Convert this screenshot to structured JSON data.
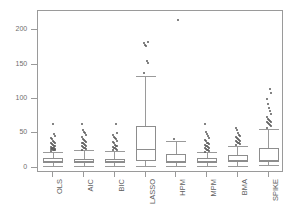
{
  "chart_data": {
    "type": "box",
    "title": "",
    "xlabel": "",
    "ylabel": "",
    "ylim": [
      -8,
      228
    ],
    "yticks": [
      0,
      50,
      100,
      150,
      200
    ],
    "ytick_labels": [
      "0",
      "50",
      "100",
      "150",
      "200"
    ],
    "grid": false,
    "legend": null,
    "categories": [
      "OLS",
      "AIC",
      "BIC",
      "LASSO",
      "HPM",
      "MPM",
      "BMA",
      "SPIKE"
    ],
    "boxes": [
      {
        "name": "OLS",
        "whisker_low": 2.0,
        "q1": 6.5,
        "median": 9.5,
        "q3": 13.5,
        "whisker_high": 23.0,
        "outliers": [
          24.0,
          25.0,
          25.5,
          26.0,
          26.5,
          27.0,
          27.5,
          28.0,
          28.5,
          29.0,
          30.0,
          31.0,
          32.0,
          33.0,
          34.0,
          35.0,
          36.0,
          37.5,
          39.0,
          41.0,
          43.0,
          46.0,
          49.0,
          64.0
        ]
      },
      {
        "name": "AIC",
        "whisker_low": 2.0,
        "q1": 6.0,
        "median": 9.0,
        "q3": 13.0,
        "whisker_high": 25.0,
        "outliers": [
          26.0,
          27.0,
          28.0,
          29.0,
          30.0,
          31.0,
          32.0,
          33.0,
          34.0,
          35.0,
          36.0,
          37.0,
          38.5,
          40.0,
          42.0,
          44.0,
          47.0,
          50.0,
          52.0,
          55.0,
          63.0
        ]
      },
      {
        "name": "BIC",
        "whisker_low": 2.0,
        "q1": 6.0,
        "median": 9.0,
        "q3": 13.0,
        "whisker_high": 24.0,
        "outliers": [
          25.0,
          26.0,
          27.0,
          28.0,
          29.0,
          30.0,
          31.0,
          32.0,
          33.5,
          35.0,
          37.0,
          39.0,
          41.0,
          43.0,
          45.0,
          48.0,
          51.0,
          63.0
        ]
      },
      {
        "name": "LASSO",
        "whisker_low": 1.5,
        "q1": 9.0,
        "median": 26.5,
        "q3": 60.5,
        "whisker_high": 133.0,
        "outliers": [
          138.0,
          152.0,
          155.0,
          177.0,
          179.0,
          182.0,
          183.5
        ]
      },
      {
        "name": "HPM",
        "whisker_low": 2.0,
        "q1": 7.0,
        "median": 10.0,
        "q3": 19.5,
        "whisker_high": 38.0,
        "outliers": [
          41.0,
          215.0
        ]
      },
      {
        "name": "MPM",
        "whisker_low": 2.0,
        "q1": 6.0,
        "median": 9.0,
        "q3": 14.0,
        "whisker_high": 22.0,
        "outliers": [
          23.0,
          24.0,
          25.0,
          26.0,
          27.0,
          28.0,
          29.0,
          30.0,
          31.0,
          32.0,
          33.0,
          34.0,
          35.0,
          36.0,
          38.0,
          40.0,
          43.0,
          46.0,
          49.0,
          52.0,
          63.0
        ]
      },
      {
        "name": "BMA",
        "whisker_low": 2.0,
        "q1": 8.0,
        "median": 11.0,
        "q3": 18.0,
        "whisker_high": 32.0,
        "outliers": [
          33.0,
          34.0,
          35.0,
          36.0,
          37.0,
          38.0,
          39.0,
          40.0,
          41.0,
          42.5,
          44.0,
          46.0,
          48.0,
          51.0,
          55.0,
          58.0
        ]
      },
      {
        "name": "SPIKE",
        "whisker_low": 3.0,
        "q1": 8.0,
        "median": 10.5,
        "q3": 28.0,
        "whisker_high": 56.0,
        "outliers": [
          58.0,
          60.0,
          62.0,
          64.0,
          65.0,
          66.0,
          67.0,
          68.0,
          69.0,
          71.0,
          74.0,
          78.0,
          82.0,
          87.0,
          93.0,
          100.0,
          108.0,
          115.0
        ]
      }
    ]
  },
  "axes": {
    "ytick_labels": [
      "0",
      "50",
      "100",
      "150",
      "200"
    ],
    "xtick_labels": [
      "OLS",
      "AIC",
      "BIC",
      "LASSO",
      "HPM",
      "MPM",
      "BMA",
      "SPIKE"
    ]
  }
}
